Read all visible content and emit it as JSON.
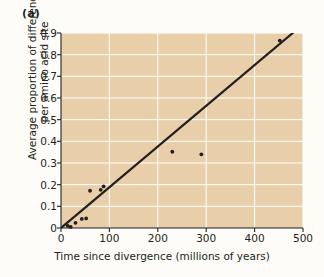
{
  "figure": {
    "panel_label": "(a)",
    "plot_background": "#e8cfa9",
    "grid_color": "#ffffff",
    "axis_color": "#231f20",
    "point_color": "#231f20",
    "line_color": "#231f20",
    "outer_background": "#fdfcf8"
  },
  "ylabel_line1": "Average proportion of differences",
  "ylabel_line2": "per amino acid site",
  "chart_data": {
    "type": "scatter",
    "title": "",
    "xlabel": "Time since divergence (millions of years)",
    "ylabel": "Average proportion of differences per amino acid site",
    "xlim": [
      0,
      500
    ],
    "ylim": [
      0,
      0.9
    ],
    "xticks": [
      0,
      100,
      200,
      300,
      400,
      500
    ],
    "yticks": [
      0,
      0.1,
      0.2,
      0.3,
      0.4,
      0.5,
      0.6,
      0.7,
      0.8,
      0.9
    ],
    "xtick_labels": [
      "0",
      "100",
      "200",
      "300",
      "400",
      "500"
    ],
    "ytick_labels": [
      "0",
      "0.1",
      "0.2",
      "0.3",
      "0.4",
      "0.5",
      "0.6",
      "0.7",
      "0.8",
      "0.9"
    ],
    "grid": true,
    "legend": "none",
    "points": [
      {
        "x": 14,
        "y": 0.01
      },
      {
        "x": 20,
        "y": 0.005
      },
      {
        "x": 30,
        "y": 0.024
      },
      {
        "x": 43,
        "y": 0.042
      },
      {
        "x": 52,
        "y": 0.044
      },
      {
        "x": 60,
        "y": 0.172
      },
      {
        "x": 82,
        "y": 0.176
      },
      {
        "x": 88,
        "y": 0.192
      },
      {
        "x": 230,
        "y": 0.352
      },
      {
        "x": 290,
        "y": 0.34
      },
      {
        "x": 452,
        "y": 0.865
      }
    ],
    "trendline": {
      "type": "linear",
      "x_start": 0,
      "y_start": 0.0,
      "x_end": 500,
      "y_end": 0.94,
      "slope": 0.00188,
      "intercept": 0.0
    }
  }
}
